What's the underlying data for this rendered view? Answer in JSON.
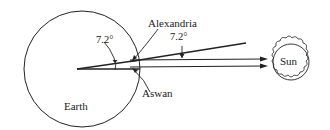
{
  "diagram": {
    "labels": {
      "earth": "Earth",
      "sun": "Sun",
      "alexandria": "Alexandria",
      "aswan": "Aswan",
      "angle_center": "7.2°",
      "angle_rays": "7.2°"
    },
    "colors": {
      "stroke": "#222222",
      "background": "#ffffff"
    }
  }
}
